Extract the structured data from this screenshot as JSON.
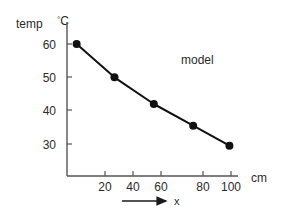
{
  "chart_data": {
    "type": "line",
    "title": "",
    "subtitle": "",
    "xlabel": "x",
    "ylabel": "temp",
    "x_unit": "cm",
    "y_unit": "°C",
    "y_unit_degree": "°",
    "y_unit_letter": "C",
    "xlim": [
      -5,
      110
    ],
    "ylim": [
      24,
      64
    ],
    "xticks": [
      20,
      40,
      60,
      80,
      100
    ],
    "xtick_labels": [
      "20",
      "40",
      "60",
      "80",
      "100"
    ],
    "yticks": [
      30,
      40,
      50,
      60
    ],
    "ytick_labels": [
      "30",
      "40",
      "50",
      "60"
    ],
    "grid": false,
    "legend_position": "none",
    "annotations": [
      {
        "text": "model",
        "x": 72,
        "y": 55
      }
    ],
    "series": [
      {
        "name": "model",
        "marker": "filled-circle",
        "color": "#111111",
        "x": [
          2,
          26,
          51,
          76,
          99
        ],
        "y": [
          60,
          50,
          42,
          35.5,
          29.5
        ],
        "points": [
          {
            "x": 2,
            "y": 60
          },
          {
            "x": 26,
            "y": 50
          },
          {
            "x": 51,
            "y": 42
          },
          {
            "x": 76,
            "y": 35.5
          },
          {
            "x": 99,
            "y": 29.5
          }
        ]
      }
    ]
  },
  "axes": {
    "y_title": "temp",
    "y_unit_degree": "°",
    "y_unit_letter": "C",
    "x_unit": "cm",
    "x_arrow_label": "x"
  },
  "ticks": {
    "y": [
      {
        "label": "60",
        "top": 38
      },
      {
        "label": "50",
        "top": 71
      },
      {
        "label": "40",
        "top": 104
      },
      {
        "label": "30",
        "top": 138
      }
    ],
    "x": [
      {
        "label": "20",
        "left": 91
      },
      {
        "label": "40",
        "left": 119
      },
      {
        "label": "60",
        "left": 147
      },
      {
        "label": "80",
        "left": 189
      },
      {
        "label": "100",
        "left": 217
      }
    ]
  },
  "colors": {
    "axis": "#555555",
    "line": "#111111",
    "marker": "#0d0d0d",
    "text": "#2b2b2b",
    "background": "#ffffff"
  }
}
